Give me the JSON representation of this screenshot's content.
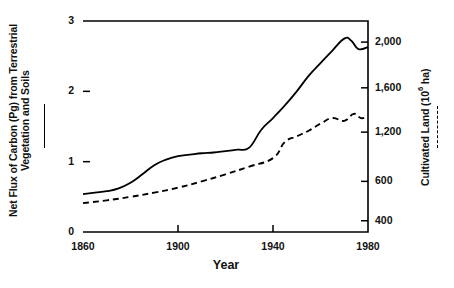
{
  "chart_data": {
    "type": "line",
    "title": "",
    "xlabel": "Year",
    "ylabel_left": "Net Flux of Carbon (Pg) from Terrestrial Vegetation and Soils",
    "ylabel_right": "Cultivated Land (10⁶ ha)",
    "xlim": [
      1860,
      1980
    ],
    "xticks": [
      1860,
      1900,
      1940,
      1980
    ],
    "xticklabels": [
      "1860",
      "1900",
      "1940",
      "1980"
    ],
    "ylim_left": [
      0,
      3
    ],
    "yticks_left": [
      0,
      1,
      2,
      3
    ],
    "yticklabels_left": [
      "0",
      "1",
      "2",
      "3"
    ],
    "yticks_right_labels": [
      "2,000",
      "1,600",
      "1,200",
      "600",
      "400"
    ],
    "grid": false,
    "legend_position": "axis-labels",
    "series": [
      {
        "name": "Net Flux of Carbon (Pg) from Terrestrial Vegetation and Soils",
        "style": "solid",
        "axis": "left",
        "x": [
          1860,
          1865,
          1870,
          1875,
          1880,
          1885,
          1890,
          1895,
          1900,
          1905,
          1910,
          1915,
          1920,
          1925,
          1930,
          1935,
          1940,
          1945,
          1950,
          1955,
          1960,
          1965,
          1970,
          1973,
          1976,
          1980
        ],
        "y": [
          0.54,
          0.56,
          0.58,
          0.62,
          0.7,
          0.82,
          0.95,
          1.03,
          1.08,
          1.1,
          1.12,
          1.13,
          1.15,
          1.17,
          1.2,
          1.45,
          1.62,
          1.8,
          2.0,
          2.22,
          2.4,
          2.58,
          2.75,
          2.72,
          2.6,
          2.63
        ]
      },
      {
        "name": "Cultivated Land (10⁶ ha)",
        "style": "dashed",
        "axis": "right",
        "x": [
          1860,
          1870,
          1880,
          1890,
          1900,
          1910,
          1920,
          1930,
          1940,
          1945,
          1950,
          1955,
          1960,
          1965,
          1970,
          1974,
          1977,
          1980
        ],
        "y": [
          0.41,
          0.45,
          0.5,
          0.56,
          0.63,
          0.72,
          0.82,
          0.93,
          1.05,
          1.28,
          1.36,
          1.44,
          1.54,
          1.62,
          1.58,
          1.68,
          1.62,
          1.64
        ]
      }
    ],
    "annotations": []
  },
  "legend": {
    "solid_marker": "solid-line",
    "dashed_marker": "dashed-line"
  }
}
